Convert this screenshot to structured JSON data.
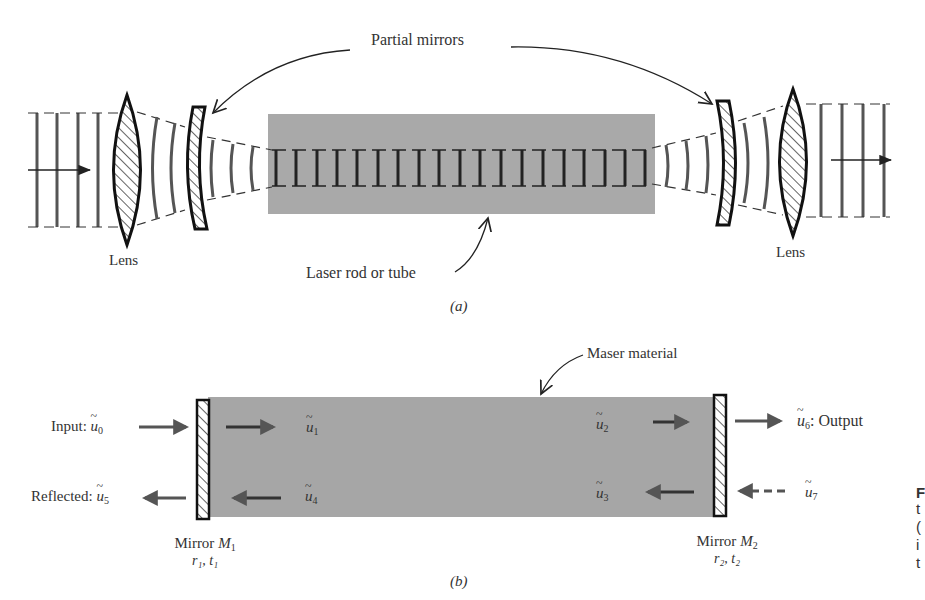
{
  "panel_a": {
    "caption": "(a)",
    "label_partial_mirrors": "Partial mirrors",
    "label_lens_left": "Lens",
    "label_lens_right": "Lens",
    "label_rod": "Laser rod or tube",
    "colors": {
      "rod_fill": "#a9a9a9",
      "stroke": "#222222",
      "wave": "#555555"
    }
  },
  "panel_b": {
    "caption": "(b)",
    "label_material": "Maser material",
    "input_label": "Input:",
    "input_sym": "u",
    "input_sub": "0",
    "reflected_label": "Reflected:",
    "reflected_sym": "u",
    "reflected_sub": "5",
    "output_label": ": Output",
    "output_sym": "u",
    "output_sub": "6",
    "u7_sym": "u",
    "u7_sub": "7",
    "u1_sym": "u",
    "u1_sub": "1",
    "u2_sym": "u",
    "u2_sub": "2",
    "u3_sym": "u",
    "u3_sub": "3",
    "u4_sym": "u",
    "u4_sub": "4",
    "mirror1_name": "Mirror",
    "mirror1_sym": "M",
    "mirror1_sub": "1",
    "mirror1_params": "r₁, t₁",
    "mirror2_name": "Mirror",
    "mirror2_sym": "M",
    "mirror2_sub": "2",
    "mirror2_params": "r₂, t₂",
    "colors": {
      "material_fill": "#a6a6a6",
      "arrow": "#555555"
    }
  },
  "edge_text": {
    "line1": "F",
    "line2": "t",
    "line3": "(",
    "line4": "i",
    "line5": "t"
  }
}
